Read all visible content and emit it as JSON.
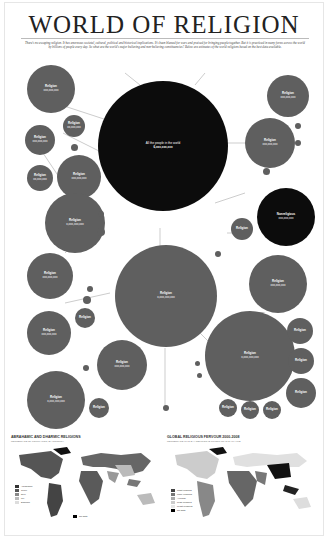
{
  "header": {
    "title": "WORLD OF RELIGION",
    "intro": "There's no escaping religion. It has enormous societal, cultural, political and historical implications. It's been blamed for wars and praised for bringing people together. But it is practiced in many forms across the world by billions of people every day. So what are the world's major believing and non-believing constituencies? Below are estimates of the world religions based on the best data available."
  },
  "world": {
    "label": "All the people in the world",
    "count": "6,xxx,xxx,xxx"
  },
  "circles": [
    {
      "id": "top-left",
      "name": "Religion",
      "count": "xxx,xxx,xxx",
      "desc": "Description text"
    },
    {
      "id": "left-mid-small",
      "name": "Religion",
      "count": "xx,xxx,xxx"
    },
    {
      "id": "left-medium",
      "name": "Religion",
      "count": "xxx,xxx,xxx"
    },
    {
      "id": "left-lower-medium",
      "name": "Religion",
      "count": "xxx,xxx,xxx",
      "desc": "Description text"
    },
    {
      "id": "left-small-bottom",
      "name": "Religion",
      "count": "xx,xxx,xxx"
    },
    {
      "id": "left-large",
      "name": "Religion",
      "count": "x,xxx,xxx,xxx",
      "desc": "Description text"
    },
    {
      "id": "left-big-lower",
      "name": "Religion",
      "count": "xxx,xxx,xxx",
      "desc": "Description text"
    },
    {
      "id": "left-bottom-1",
      "name": "Religion",
      "count": "xxx,xxx,xxx",
      "desc": "Description text"
    },
    {
      "id": "left-bottom-2",
      "name": "Religion",
      "count": "xxx,xxx,xxx",
      "desc": "Description text"
    },
    {
      "id": "left-bottom-3",
      "name": "Religion",
      "count": "xx,xxx,xxx"
    },
    {
      "id": "center-large",
      "name": "Religion",
      "count": "x,xxx,xxx,xxx",
      "desc": "Description text"
    },
    {
      "id": "center-lower",
      "name": "Religion",
      "count": "xxx,xxx,xxx",
      "desc": "Description text"
    },
    {
      "id": "right-top",
      "name": "Religion",
      "count": "xxx,xxx,xxx"
    },
    {
      "id": "right-upper",
      "name": "Religion",
      "count": "xxx,xxx,xxx",
      "desc": "Description text"
    },
    {
      "id": "right-black",
      "name": "Nonreligious",
      "count": "xxx,xxx,xxx",
      "desc": "Description text"
    },
    {
      "id": "right-small",
      "name": "Religion",
      "count": "xx,xxx,xxx"
    },
    {
      "id": "right-mid",
      "name": "Religion",
      "count": "xxx,xxx,xxx",
      "desc": "Description text"
    },
    {
      "id": "right-lower-large",
      "name": "Religion",
      "count": "x,xxx,xxx,xxx",
      "desc": "Description text"
    },
    {
      "id": "right-lower-1",
      "name": "Religion",
      "count": "xx,xxx,xxx"
    },
    {
      "id": "right-lower-2",
      "name": "Religion",
      "count": "xx,xxx,xxx"
    },
    {
      "id": "right-lower-3",
      "name": "Religion",
      "count": "xx,xxx,xxx"
    },
    {
      "id": "bottom-row-1",
      "name": "Religion",
      "count": "xx,xxx,xxx"
    },
    {
      "id": "bottom-row-2",
      "name": "Religion",
      "count": "xx,xxx,xxx"
    },
    {
      "id": "bottom-row-3",
      "name": "Religion",
      "count": "xx,xxx,xxx"
    }
  ],
  "maps": {
    "left": {
      "title": "ABRAHAMIC AND DHARMIC RELIGIONS",
      "subtitle": "PERCENTAGE OF POPULATION, BY COUNTRY",
      "legend": [
        "Abrahamic",
        "100%",
        "",
        "50%",
        "",
        "0%",
        "Dharmic",
        "No data"
      ]
    },
    "right": {
      "title": "GLOBAL RELIGIOUS FERVOUR 2000-2008",
      "subtitle": "PERCENTAGE WHO SAY RELIGION IS IMPORTANT IN DAILY LIFE",
      "legend": [
        "Most religious",
        "More religious",
        "Average",
        "Less religious",
        "Least religious",
        "No data"
      ]
    }
  },
  "colors": {
    "circle_gray": "#5f5f5f",
    "circle_black": "#0c0c0c",
    "text": "#222222"
  }
}
